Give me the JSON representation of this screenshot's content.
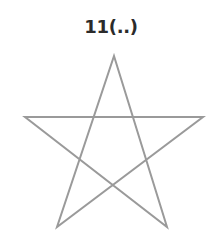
{
  "canvas": {
    "width": 218,
    "height": 248,
    "background_color": "#ffffff"
  },
  "label": {
    "text": "11(..)",
    "color": "#2b2b2b",
    "font_size_px": 18,
    "center_x": 111,
    "top_y": 17
  },
  "figure": {
    "name": "pentagram",
    "shape_kind": "five-pointed-star-open-unicursal",
    "stroke_color": "#9a9a9a",
    "stroke_width_px": 2,
    "fill": "none",
    "points": [
      {
        "name": "top",
        "x": 114,
        "y": 56
      },
      {
        "name": "right",
        "x": 203,
        "y": 117
      },
      {
        "name": "bottom-right",
        "x": 167,
        "y": 227
      },
      {
        "name": "bottom-left",
        "x": 57,
        "y": 227
      },
      {
        "name": "left",
        "x": 25,
        "y": 117
      }
    ],
    "path_order": [
      "top",
      "bottom-right",
      "left",
      "right",
      "bottom-left",
      "top"
    ],
    "path_d": "M 114 56 L 167 227 L 25 117 L 203 117 L 57 227 Z"
  }
}
